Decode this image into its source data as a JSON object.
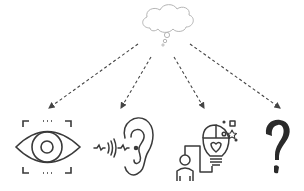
{
  "diagram": {
    "title": "",
    "source": {
      "name": "thought-cloud",
      "icon": "thought-bubble-icon"
    },
    "targets": [
      {
        "name": "vision",
        "icon": "eye-icon"
      },
      {
        "name": "hearing",
        "icon": "ear-icon"
      },
      {
        "name": "idea",
        "icon": "person-lightbulb-icon"
      },
      {
        "name": "unknown",
        "icon": "question-mark-icon"
      }
    ],
    "edges": [
      {
        "from": "thought-cloud",
        "to": "vision",
        "style": "dashed-arrow"
      },
      {
        "from": "thought-cloud",
        "to": "hearing",
        "style": "dashed-arrow"
      },
      {
        "from": "thought-cloud",
        "to": "idea",
        "style": "dashed-arrow"
      },
      {
        "from": "thought-cloud",
        "to": "unknown",
        "style": "dashed-arrow"
      }
    ],
    "colors": {
      "stroke": "#3a3a3a",
      "cloud": "#b8b8b8",
      "background": "#ffffff"
    }
  }
}
